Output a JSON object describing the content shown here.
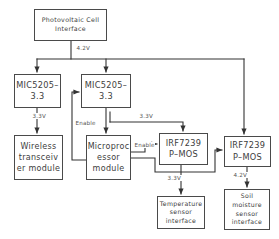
{
  "diagram": {
    "type": "block-diagram",
    "stroke_color": "#4a4a4a",
    "text_color": "#3d3d3d",
    "label_color": "#555555",
    "background": "#ffffff",
    "nodes": {
      "pv_interface": "Photovoltaic Cell\nInterface",
      "mic_left": "MIC5205–\n3.3",
      "mic_right": "MIC5205–\n3.3",
      "wireless": "Wireless\ntransceiv\ner module",
      "microprocessor": "Microproc\nessor\nmodule",
      "mos_center": "IRF7239\nP–MOS",
      "mos_right": "IRF7239\nP–MOS",
      "temperature": "Temperature\nsensor\ninterface",
      "soil": "Soil\nmoisture\nsensor\ninterface"
    },
    "wire_labels": {
      "pv_out": "4.2V",
      "mic_left_out": "3.3V",
      "enable_mic": "Enable",
      "mic_right_out": "3.3V",
      "enable_mos": "Enable",
      "mos_center_out": "3.3V",
      "mos_right_out": "4.2V"
    },
    "edges": [
      {
        "from": "pv_interface",
        "to": "bus",
        "label": "4.2V"
      },
      {
        "from": "bus",
        "to": "mic_left",
        "label": ""
      },
      {
        "from": "bus",
        "to": "mic_right",
        "label": ""
      },
      {
        "from": "bus",
        "to": "mos_right",
        "label": ""
      },
      {
        "from": "mic_left",
        "to": "wireless",
        "label": "3.3V"
      },
      {
        "from": "microprocessor",
        "to": "mic_right",
        "label": "Enable"
      },
      {
        "from": "mic_right",
        "to": "microprocessor",
        "label": "3.3V"
      },
      {
        "from": "mic_right",
        "to": "mos_center",
        "label": "3.3V"
      },
      {
        "from": "microprocessor",
        "to": "mos_center",
        "label": "Enable"
      },
      {
        "from": "microprocessor",
        "to": "mos_right",
        "label": ""
      },
      {
        "from": "mos_center",
        "to": "temperature",
        "label": "3.3V"
      },
      {
        "from": "mos_right",
        "to": "soil",
        "label": "4.2V"
      }
    ]
  }
}
